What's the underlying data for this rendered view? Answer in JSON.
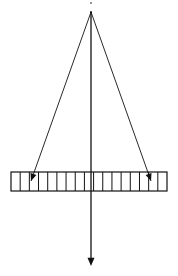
{
  "diagram": {
    "colors": {
      "stroke": "#111111",
      "background": "#ffffff"
    },
    "source_point": {
      "x": 91,
      "y": 12
    },
    "top_dot": {
      "x": 91,
      "y": 3
    },
    "grating": {
      "x": 11,
      "y": 172,
      "width": 156,
      "height": 19,
      "segments": 17
    },
    "rays": [
      {
        "name": "left-ray",
        "from": [
          91,
          12
        ],
        "to": [
          31,
          181
        ]
      },
      {
        "name": "right-ray",
        "from": [
          91,
          12
        ],
        "to": [
          151,
          181
        ]
      }
    ],
    "central_axis": {
      "from": [
        91,
        12
      ],
      "to": [
        91,
        266
      ]
    }
  }
}
